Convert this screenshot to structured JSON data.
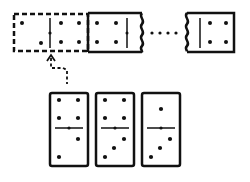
{
  "diagram": {
    "ink_color": "#111111",
    "background_color": "#ffffff",
    "chain": {
      "placeholder": {
        "label": "empty slot",
        "left_pips": 2,
        "right_pips": 4,
        "style": "dashed"
      },
      "first_domino": {
        "left_pips": 4,
        "right_pips": 0,
        "edge": "wavy-right"
      },
      "ellipsis": "···",
      "last_domino": {
        "left_pips": 0,
        "right_pips": 4,
        "edge": "wavy-left"
      }
    },
    "arrow": {
      "label": "dashed arrow pointing up from candidates to the placeholder slot"
    },
    "candidates": [
      {
        "top_pips": 4,
        "bottom_pips": 2
      },
      {
        "top_pips": 4,
        "bottom_pips": 3
      },
      {
        "top_pips": 1,
        "bottom_pips": 3
      }
    ]
  }
}
